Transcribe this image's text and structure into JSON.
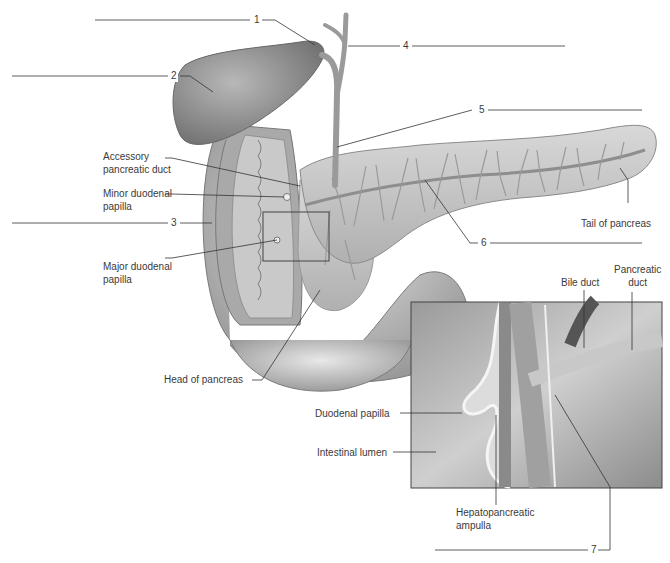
{
  "figure": {
    "numbered_labels": [
      {
        "id": 1,
        "text": "1"
      },
      {
        "id": 2,
        "text": "2"
      },
      {
        "id": 3,
        "text": "3"
      },
      {
        "id": 4,
        "text": "4"
      },
      {
        "id": 5,
        "text": "5"
      },
      {
        "id": 6,
        "text": "6"
      },
      {
        "id": 7,
        "text": "7"
      }
    ],
    "text_labels": {
      "accessory_duct_1": "Accessory",
      "accessory_duct_2": "pancreatic duct",
      "minor_papilla_1": "Minor duodenal",
      "minor_papilla_2": "papilla",
      "major_papilla_1": "Major duodenal",
      "major_papilla_2": "papilla",
      "tail": "Tail of pancreas",
      "head": "Head of pancreas",
      "bile_duct": "Bile duct",
      "pancreatic_duct_1": "Pancreatic",
      "pancreatic_duct_2": "duct",
      "duodenal_papilla": "Duodenal papilla",
      "intestinal_lumen": "Intestinal lumen",
      "ampulla_1": "Hepatopancreatic",
      "ampulla_2": "ampulla"
    },
    "colors": {
      "organ_fill": "#bdbdbd",
      "organ_dark": "#8a8a8a",
      "organ_light": "#dedede",
      "duct": "#9a9a9a",
      "leader": "#333333",
      "inset_border": "#444444"
    }
  }
}
